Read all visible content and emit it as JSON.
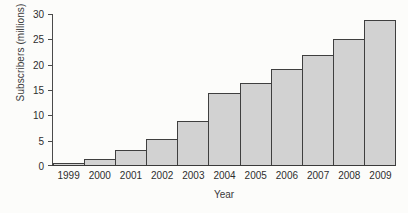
{
  "chart_data": {
    "type": "bar",
    "title": "",
    "xlabel": "Year",
    "ylabel": "Subscribers (millions)",
    "categories": [
      "1999",
      "2000",
      "2001",
      "2002",
      "2003",
      "2004",
      "2005",
      "2006",
      "2007",
      "2008",
      "2009"
    ],
    "values": [
      0.4,
      1.1,
      2.9,
      5.1,
      8.7,
      14.2,
      16.1,
      19.0,
      21.8,
      24.9,
      28.7
    ],
    "ylim": [
      0,
      30
    ],
    "yticks": [
      "0",
      "5",
      "10",
      "15",
      "20",
      "25",
      "30"
    ],
    "ytick_values": [
      0,
      5,
      10,
      15,
      20,
      25,
      30
    ],
    "grid": false,
    "legend": "none",
    "bar_fill_color": "#d2d2d2",
    "bar_edge_color": "#3f3f3f",
    "background_color": "#fcfcfa"
  }
}
